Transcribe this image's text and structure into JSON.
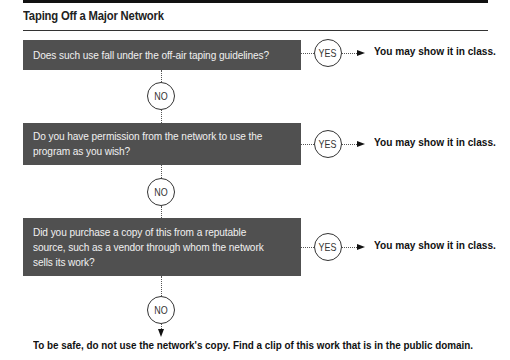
{
  "figure": {
    "title": "Taping Off a Major Network",
    "questions": [
      {
        "text": "Does such use fall under the off-air taping guidelines?",
        "yes_label": "YES",
        "yes_outcome": "You may show it in class.",
        "no_label": "NO"
      },
      {
        "text": "Do you have permission from the network to use the program as you wish?",
        "yes_label": "YES",
        "yes_outcome": "You may show it in class.",
        "no_label": "NO"
      },
      {
        "text": "Did you purchase a copy of this from a reputable source, such as a vendor through whom the network sells its work?",
        "yes_label": "YES",
        "yes_outcome": "You may show it in class.",
        "no_label": "NO"
      }
    ],
    "final_outcome": "To be safe, do not use the network's copy. Find a clip of this work that is in the public domain."
  },
  "colors": {
    "question_box": "#505050",
    "question_text": "#f0f0f0",
    "rule": "#333333"
  }
}
